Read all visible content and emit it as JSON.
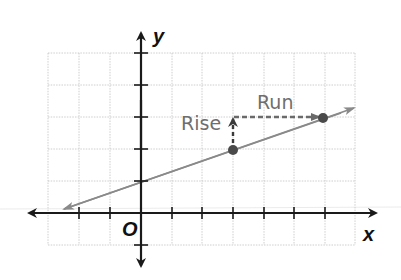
{
  "diagram": {
    "type": "coordinate-plane-slope",
    "axis_labels": {
      "x": "x",
      "y": "y",
      "origin": "O"
    },
    "annotations": {
      "rise": "Rise",
      "run": "Run"
    },
    "grid": {
      "x_range": [
        -3,
        7
      ],
      "y_range": [
        -1,
        5
      ],
      "unit": 1
    },
    "line": {
      "equation": "y = (1/3)x + 1",
      "y_intercept": [
        0,
        1
      ],
      "direction": "both-arrows",
      "start_arrow_at": [
        -3,
        0
      ],
      "end_arrow_at": [
        7,
        3.33
      ]
    },
    "points": [
      {
        "x": 3,
        "y": 2
      },
      {
        "x": 6,
        "y": 3
      }
    ],
    "rise_segment": {
      "from": [
        3,
        2
      ],
      "to": [
        3,
        3
      ],
      "value": 1
    },
    "run_segment": {
      "from": [
        3,
        3
      ],
      "to": [
        6,
        3
      ],
      "value": 3
    },
    "colors": {
      "axis": "#1a1a1a",
      "grid": "#c8c8c8",
      "line": "#8a8a8a",
      "labels": "#6e6e6e",
      "points": "#4a4a4a"
    }
  }
}
